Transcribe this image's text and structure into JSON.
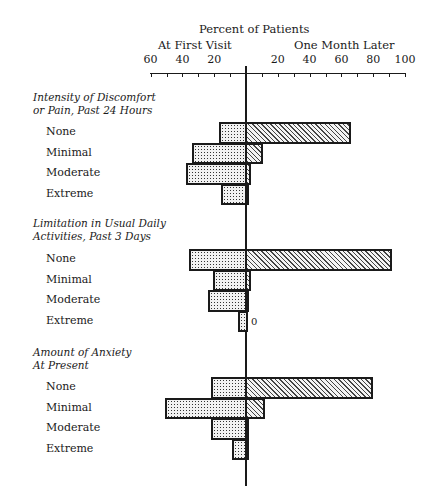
{
  "chart_data": {
    "type": "bar",
    "orientation": "horizontal-diverging",
    "title": "Percent of Patients",
    "left_label": "At First Visit",
    "right_label": "One Month Later",
    "xlabel": "Percent of Patients",
    "left_ticks": [
      "60",
      "40",
      "20"
    ],
    "right_ticks": [
      "20",
      "40",
      "60",
      "80",
      "100"
    ],
    "xlim_left": [
      0,
      60
    ],
    "xlim_right": [
      0,
      100
    ],
    "grid": false,
    "legend": "none (patterns: dotted = At First Visit, hatched = One Month Later)",
    "categories": [
      "None",
      "Minimal",
      "Moderate",
      "Extreme"
    ],
    "groups": [
      {
        "title": "Intensity of Discomfort or Pain, Past 24 Hours",
        "title_lines": [
          "Intensity of Discomfort",
          "or Pain, Past 24 Hours"
        ],
        "series": [
          {
            "name": "At First Visit",
            "values": [
              17,
              34,
              38,
              16
            ]
          },
          {
            "name": "One Month Later",
            "values": [
              66,
              11,
              3,
              1
            ]
          }
        ]
      },
      {
        "title": "Limitation in Usual Daily Activities, Past 3 Days",
        "title_lines": [
          "Limitation in Usual Daily",
          "Activities, Past 3 Days"
        ],
        "series": [
          {
            "name": "At First Visit",
            "values": [
              36,
              21,
              24,
              5
            ]
          },
          {
            "name": "One Month Later",
            "values": [
              92,
              3,
              1,
              0
            ]
          }
        ],
        "annotation": "0"
      },
      {
        "title": "Amount of Anxiety At Present",
        "title_lines": [
          "Amount of Anxiety",
          "At Present"
        ],
        "series": [
          {
            "name": "At First Visit",
            "values": [
              22,
              51,
              22,
              9
            ]
          },
          {
            "name": "One Month Later",
            "values": [
              80,
              12,
              2,
              1
            ]
          }
        ]
      }
    ]
  },
  "layout": {
    "center_x": 246,
    "px_per_pct": 1.59,
    "group_tops": [
      122,
      249,
      377
    ],
    "bar_height": 20.5,
    "title_tops": [
      91,
      217,
      346
    ],
    "left_tick_values": [
      60,
      50,
      40,
      30,
      20,
      10
    ],
    "right_tick_values": [
      10,
      20,
      30,
      40,
      50,
      60,
      70,
      80,
      90,
      100
    ]
  }
}
